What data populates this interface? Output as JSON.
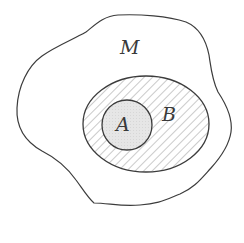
{
  "diagram": {
    "type": "venn-nested-sets",
    "sets": [
      {
        "id": "M",
        "label": "M",
        "shape": "irregular-blob",
        "fill": "#ffffff",
        "role": "universe"
      },
      {
        "id": "B",
        "label": "B",
        "shape": "ellipse",
        "fill": "diagonal-hatch",
        "contains": [
          "A"
        ]
      },
      {
        "id": "A",
        "label": "A",
        "shape": "ellipse",
        "fill": "#e4e4e4"
      }
    ],
    "relations": [
      "A ⊂ B",
      "B ⊂ M"
    ]
  },
  "labels": {
    "m": "M",
    "b": "B",
    "a": "A"
  },
  "colors": {
    "stroke": "#3c3c3c",
    "hatch": "#8a8a8a",
    "a_fill": "#e4e4e4",
    "background": "#ffffff"
  }
}
